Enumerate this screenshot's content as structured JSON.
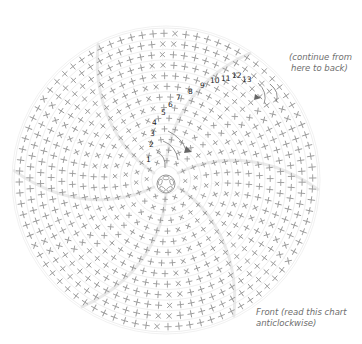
{
  "header_fragment": "",
  "annotations": {
    "continue": "(continue from here to back)",
    "continue_line1": "(continue from",
    "continue_line2": "here to back)",
    "front": "Front (read this chart anticlockwise)",
    "front_line1": "Front (read this chart",
    "front_line2": "anticlockwise)"
  },
  "round_numbers": [
    "1",
    "2",
    "3",
    "4",
    "5",
    "6",
    "7",
    "8",
    "9",
    "10",
    "11",
    "12",
    "13"
  ],
  "chart": {
    "type": "crochet-round-chart",
    "center": [
      166,
      180
    ],
    "rounds": 13,
    "increase_lines": 6,
    "symbols": {
      "plus": "double crochet/ stitch",
      "x": "increase stitch"
    },
    "colors": {
      "stitch": "#9a9a9a",
      "grid": "#e2e2e2",
      "label": "#222222",
      "note": "#6e6e6e",
      "arrow": "#777777"
    }
  }
}
